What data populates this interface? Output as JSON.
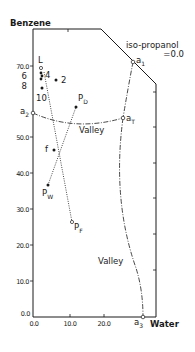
{
  "diagram": {
    "y_axis_title": "Benzene",
    "corner_label": "iso-propanol",
    "corner_value": "=0.0",
    "x_corner_label": "Water",
    "region_label_upper": "Valley",
    "region_label_lower": "Valley",
    "y_ticks": [
      "70.0",
      "50.0",
      "40.0",
      "30.0",
      "20.0",
      "10.0",
      "0.0"
    ],
    "x_ticks": [
      "0.0",
      "10.0",
      "20.0"
    ],
    "points": {
      "L": {
        "label": "L"
      },
      "p4": {
        "label": "4"
      },
      "p2": {
        "label": "2"
      },
      "p6": {
        "label": "6"
      },
      "p8": {
        "label": "8"
      },
      "p10": {
        "label": "10"
      },
      "PD": {
        "label": "P",
        "sub": "D"
      },
      "f": {
        "label": "f"
      },
      "PW": {
        "label": "P",
        "sub": "W"
      },
      "PF": {
        "label": "P",
        "sub": "F"
      },
      "a1": {
        "label": "a",
        "sub": "1"
      },
      "a2": {
        "label": "a",
        "sub": "2"
      },
      "aT": {
        "label": "a",
        "sub": "T"
      },
      "a3": {
        "label": "a",
        "sub": "3"
      }
    },
    "colors": {
      "ink": "#1a1a1a",
      "background": "#ffffff"
    }
  }
}
